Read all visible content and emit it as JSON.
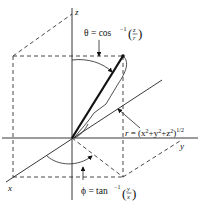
{
  "diagram": {
    "axes": {
      "z_label": "z",
      "y_label": "y",
      "x_label": "x"
    },
    "labels": {
      "theta": {
        "lhs": "θ = cos",
        "exp": "−1",
        "num": "z",
        "den": "r"
      },
      "r": {
        "lhs": "r",
        "rhs": " = (x",
        "sq1": "2",
        "plus1": "+y",
        "sq2": "2",
        "plus2": "+z",
        "sq3": "2",
        "close": ")",
        "exp": "1/2"
      },
      "phi": {
        "lhs": "ϕ = tan",
        "exp": "−1",
        "num": "y",
        "den": "x"
      }
    },
    "colors": {
      "line": "#222222",
      "background": "#ffffff"
    }
  }
}
